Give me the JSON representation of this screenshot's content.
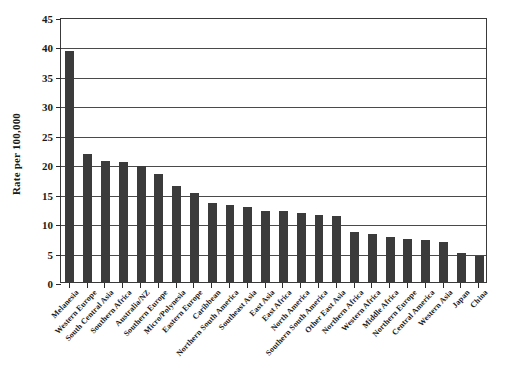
{
  "chart_data": {
    "type": "bar",
    "title": "",
    "xlabel": "",
    "ylabel": "Rate per 100,000",
    "ylim": [
      0,
      45
    ],
    "ytick_values": [
      0,
      5,
      10,
      15,
      20,
      25,
      30,
      35,
      40,
      45
    ],
    "ytick_labels": [
      "0",
      "5",
      "10",
      "15",
      "20",
      "25",
      "30",
      "35",
      "40",
      "45"
    ],
    "grid": "horizontal",
    "legend": "none",
    "bar_color": "#3b3b3b",
    "categories": [
      "Melanesia",
      "Western Europe",
      "South Central Asia",
      "Southern Africa",
      "Australia/NZ",
      "Southern Europe",
      "Micro/Polynesia",
      "Eastern Europe",
      "Caribbean",
      "Northern South America",
      "Southeast Asia",
      "East Asia",
      "East Africa",
      "North America",
      "Southern South America",
      "Other East Asia",
      "Northern Africa",
      "Western Africa",
      "Middle Africa",
      "Northern Europe",
      "Central America",
      "Western Asia",
      "Japan",
      "China"
    ],
    "values": [
      39.3,
      21.8,
      20.6,
      20.4,
      19.7,
      18.3,
      16.3,
      15.2,
      13.5,
      13.1,
      12.7,
      12.1,
      12.0,
      11.7,
      11.4,
      11.2,
      8.5,
      8.1,
      7.6,
      7.3,
      7.2,
      6.8,
      5.0,
      4.5
    ]
  }
}
